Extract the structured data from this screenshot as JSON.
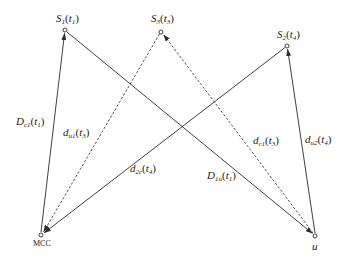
{
  "diagram": {
    "type": "network-timing-diagram",
    "colors": {
      "line": "#2a2a2a",
      "background": "#ffffff"
    },
    "nodes": [
      {
        "id": "S1",
        "label": "S",
        "sub": "1",
        "arg": "t",
        "arg_sub": "1",
        "x": 65,
        "y": 30
      },
      {
        "id": "S3",
        "label": "S",
        "sub": "3",
        "arg": "t",
        "arg_sub": "3",
        "x": 161,
        "y": 32
      },
      {
        "id": "S2",
        "label": "S",
        "sub": "2",
        "arg": "t",
        "arg_sub": "4",
        "x": 287,
        "y": 46
      },
      {
        "id": "MCC",
        "label": "MCC",
        "x": 41,
        "y": 235
      },
      {
        "id": "u",
        "label": "u",
        "x": 315,
        "y": 236
      }
    ],
    "edges": [
      {
        "from": "MCC",
        "to": "S1",
        "style": "solid",
        "label": "D",
        "sub": "c1",
        "arg_sub": "1"
      },
      {
        "from": "S1",
        "to": "u",
        "style": "solid",
        "label": "D",
        "sub": "1u",
        "arg_sub": "1"
      },
      {
        "from": "S3",
        "to": "MCC",
        "style": "dashed",
        "label": "d",
        "sub": "u1",
        "arg_sub": "3"
      },
      {
        "from": "u",
        "to": "S3",
        "style": "dashed",
        "label": "d",
        "sub": "c1",
        "arg_sub": "3"
      },
      {
        "from": "S2",
        "to": "MCC",
        "style": "solid",
        "label": "d",
        "sub": "2c",
        "arg_sub": "4"
      },
      {
        "from": "u",
        "to": "S2",
        "style": "solid",
        "label": "d",
        "sub": "u2",
        "arg_sub": "4"
      }
    ]
  },
  "labels": {
    "s1": {
      "main": "S",
      "sub": "1",
      "open": "(",
      "t": "t",
      "tsub": "1",
      "close": ")"
    },
    "s3": {
      "main": "S",
      "sub": "3",
      "open": "(",
      "t": "t",
      "tsub": "3",
      "close": ")"
    },
    "s2": {
      "main": "S",
      "sub": "2",
      "open": "(",
      "t": "t",
      "tsub": "4",
      "close": ")"
    },
    "mcc": "MCC",
    "u": "u",
    "dc1": {
      "main": "D",
      "sub": "c1",
      "open": "(",
      "t": "t",
      "tsub": "1",
      "close": ")"
    },
    "du1": {
      "main": "d",
      "sub": "u1",
      "open": "(",
      "t": "t",
      "tsub": "3",
      "close": ")"
    },
    "d2c": {
      "main": "d",
      "sub": "2c",
      "open": "(",
      "t": "t",
      "tsub": "4",
      "close": ")"
    },
    "d1u": {
      "main": "D",
      "sub": "1u",
      "open": "(",
      "t": "t",
      "tsub": "1",
      "close": ")"
    },
    "dc1b": {
      "main": "d",
      "sub": "c1",
      "open": "(",
      "t": "t",
      "tsub": "3",
      "close": ")"
    },
    "du2": {
      "main": "d",
      "sub": "u2",
      "open": "(",
      "t": "t",
      "tsub": "4",
      "close": ")"
    }
  }
}
